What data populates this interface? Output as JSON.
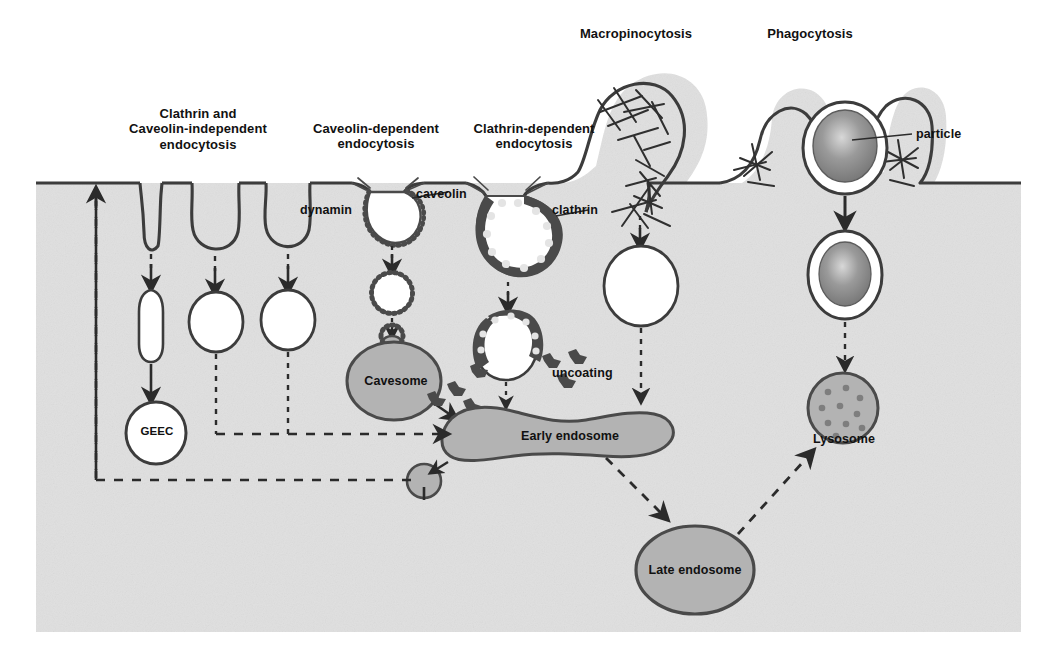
{
  "figure": {
    "colors": {
      "cytoplasm": "#e0e0e0",
      "membrane": "#3c3c3c",
      "organelle_fill": "#b3b3b3",
      "organelle_stroke": "#4a4a4a",
      "vesicle_fill": "#ffffff",
      "coat": "#4a4a4a",
      "particle": "#8a8a8a",
      "text": "#111111",
      "arrow": "#2b2b2b"
    }
  },
  "pathway_labels": [
    {
      "id": "clathrin-caveolin-independent",
      "text": "Clathrin and\nCaveolin-independent\nendocytosis",
      "x": 98,
      "y": 106,
      "w": 200,
      "size": "t13"
    },
    {
      "id": "caveolin-dependent",
      "text": "Caveolin-dependent\nendocytosis",
      "x": 292,
      "y": 121,
      "w": 168,
      "size": "t13"
    },
    {
      "id": "clathrin-dependent",
      "text": "Clathrin-dependent\nendocytosis",
      "x": 450,
      "y": 121,
      "w": 168,
      "size": "t13"
    },
    {
      "id": "macropinocytosis",
      "text": "Macropinocytosis",
      "x": 556,
      "y": 26,
      "w": 160,
      "size": "t13"
    },
    {
      "id": "phagocytosis",
      "text": "Phagocytosis",
      "x": 730,
      "y": 26,
      "w": 160,
      "size": "t13"
    }
  ],
  "component_labels": [
    {
      "id": "dynamin",
      "text": "dynamin",
      "x": 300,
      "y": 203,
      "w": 76,
      "size": "t12",
      "align": "left"
    },
    {
      "id": "caveolin",
      "text": "caveolin",
      "x": 416,
      "y": 187,
      "w": 72,
      "size": "t12",
      "align": "left"
    },
    {
      "id": "clathrin",
      "text": "clathrin",
      "x": 552,
      "y": 203,
      "w": 66,
      "size": "t12",
      "align": "left"
    },
    {
      "id": "particle",
      "text": "particle",
      "x": 916,
      "y": 130,
      "w": 66,
      "size": "t12",
      "align": "left"
    },
    {
      "id": "uncoating",
      "text": "uncoating",
      "x": 552,
      "y": 366,
      "w": 84,
      "size": "t12",
      "align": "left"
    }
  ],
  "organelle_labels": [
    {
      "id": "geec",
      "text": "GEEC",
      "x": 132,
      "y": 424,
      "w": 50,
      "size": "t11"
    },
    {
      "id": "cavesome",
      "text": "Cavesome",
      "x": 352,
      "y": 373,
      "w": 88,
      "size": "t12"
    },
    {
      "id": "early-endosome",
      "text": "Early endosome",
      "x": 508,
      "y": 428,
      "w": 124,
      "size": "t12"
    },
    {
      "id": "late-endosome",
      "text": "Late endosome",
      "x": 633,
      "y": 564,
      "w": 124,
      "size": "t12"
    },
    {
      "id": "lysosome",
      "text": "Lysosome",
      "x": 820,
      "y": 432,
      "w": 92,
      "size": "t12"
    }
  ],
  "structures": {
    "membrane_top_y": 183,
    "cytoplasm_rect": {
      "x": 36,
      "y": 183,
      "w": 985,
      "h": 449
    },
    "columns": [
      {
        "id": "geec-pathway",
        "x": 150,
        "invagination": "tubular"
      },
      {
        "id": "independent-vesicle-a",
        "x": 215,
        "invagination": "round"
      },
      {
        "id": "independent-vesicle-b",
        "x": 285,
        "invagination": "round-dynamin"
      },
      {
        "id": "caveolin-pathway",
        "x": 385,
        "invagination": "caveolin-coated"
      },
      {
        "id": "clathrin-pathway",
        "x": 500,
        "invagination": "clathrin-coated"
      },
      {
        "id": "macropinocytosis-pathway",
        "x": 640,
        "invagination": "ruffle"
      },
      {
        "id": "phagocytosis-pathway",
        "x": 845,
        "invagination": "cup"
      }
    ]
  }
}
